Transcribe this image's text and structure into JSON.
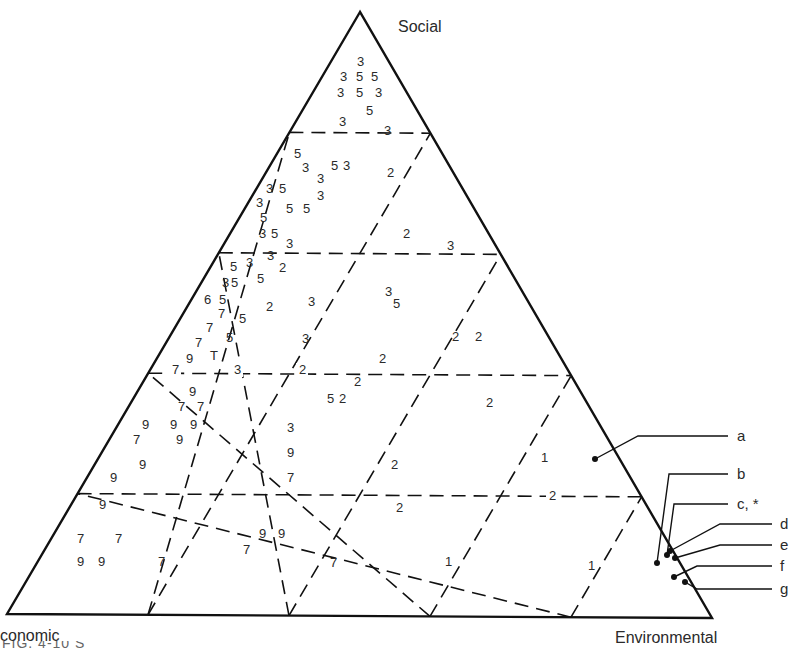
{
  "diagram": {
    "type": "ternary-diagram",
    "vertices": {
      "top": {
        "label": "Social",
        "x": 360,
        "y": 12
      },
      "bottom_left": {
        "label": "conomic",
        "x": 7,
        "y": 614
      },
      "bottom_right": {
        "label": "Environmental",
        "x": 712,
        "y": 618
      }
    },
    "grid_divisions": 5,
    "line_color": "#111111",
    "grid_line_labels": [
      {
        "text": "3",
        "x": 339,
        "y": 126
      },
      {
        "text": "3",
        "x": 286,
        "y": 248
      },
      {
        "text": "3",
        "x": 447,
        "y": 250
      },
      {
        "text": "7",
        "x": 172,
        "y": 374
      },
      {
        "text": "3",
        "x": 234,
        "y": 374
      },
      {
        "text": "2",
        "x": 299,
        "y": 374
      },
      {
        "text": "2",
        "x": 549,
        "y": 500
      }
    ],
    "points": [
      {
        "text": "3",
        "x": 357,
        "y": 66
      },
      {
        "text": "3",
        "x": 340,
        "y": 81
      },
      {
        "text": "5",
        "x": 356,
        "y": 81
      },
      {
        "text": "5",
        "x": 371,
        "y": 81
      },
      {
        "text": "3",
        "x": 337,
        "y": 97
      },
      {
        "text": "5",
        "x": 356,
        "y": 97
      },
      {
        "text": "3",
        "x": 375,
        "y": 97
      },
      {
        "text": "5",
        "x": 366,
        "y": 115
      },
      {
        "text": "3",
        "x": 384,
        "y": 135
      },
      {
        "text": "5",
        "x": 294,
        "y": 158
      },
      {
        "text": "3",
        "x": 302,
        "y": 172
      },
      {
        "text": "5",
        "x": 331,
        "y": 170
      },
      {
        "text": "3",
        "x": 343,
        "y": 170
      },
      {
        "text": "3",
        "x": 317,
        "y": 183
      },
      {
        "text": "2",
        "x": 387,
        "y": 177
      },
      {
        "text": "3",
        "x": 266,
        "y": 193
      },
      {
        "text": "5",
        "x": 279,
        "y": 193
      },
      {
        "text": "3",
        "x": 317,
        "y": 200
      },
      {
        "text": "3",
        "x": 256,
        "y": 207
      },
      {
        "text": "5",
        "x": 286,
        "y": 213
      },
      {
        "text": "5",
        "x": 303,
        "y": 213
      },
      {
        "text": "5",
        "x": 260,
        "y": 222
      },
      {
        "text": "3",
        "x": 259,
        "y": 238
      },
      {
        "text": "5",
        "x": 271,
        "y": 238
      },
      {
        "text": "2",
        "x": 403,
        "y": 238
      },
      {
        "text": "3",
        "x": 267,
        "y": 260
      },
      {
        "text": "5",
        "x": 230,
        "y": 271
      },
      {
        "text": "3",
        "x": 246,
        "y": 267
      },
      {
        "text": "2",
        "x": 279,
        "y": 272
      },
      {
        "text": "3",
        "x": 222,
        "y": 287
      },
      {
        "text": "5",
        "x": 231,
        "y": 287
      },
      {
        "text": "5",
        "x": 257,
        "y": 283
      },
      {
        "text": "6",
        "x": 204,
        "y": 304
      },
      {
        "text": "5",
        "x": 219,
        "y": 304
      },
      {
        "text": "2",
        "x": 266,
        "y": 311
      },
      {
        "text": "3",
        "x": 308,
        "y": 306
      },
      {
        "text": "3",
        "x": 385,
        "y": 296
      },
      {
        "text": "7",
        "x": 218,
        "y": 318
      },
      {
        "text": "5",
        "x": 239,
        "y": 323
      },
      {
        "text": "5",
        "x": 393,
        "y": 308
      },
      {
        "text": "7",
        "x": 206,
        "y": 332
      },
      {
        "text": "7",
        "x": 195,
        "y": 347
      },
      {
        "text": "5",
        "x": 226,
        "y": 342
      },
      {
        "text": "3",
        "x": 302,
        "y": 343
      },
      {
        "text": "2",
        "x": 452,
        "y": 341
      },
      {
        "text": "2",
        "x": 475,
        "y": 341
      },
      {
        "text": "9",
        "x": 186,
        "y": 363
      },
      {
        "text": "T",
        "x": 210,
        "y": 360
      },
      {
        "text": "2",
        "x": 379,
        "y": 363
      },
      {
        "text": "2",
        "x": 354,
        "y": 386
      },
      {
        "text": "9",
        "x": 189,
        "y": 396
      },
      {
        "text": "5",
        "x": 327,
        "y": 403
      },
      {
        "text": "2",
        "x": 339,
        "y": 403
      },
      {
        "text": "2",
        "x": 486,
        "y": 407
      },
      {
        "text": "7",
        "x": 178,
        "y": 411
      },
      {
        "text": "7",
        "x": 197,
        "y": 411
      },
      {
        "text": "9",
        "x": 142,
        "y": 429
      },
      {
        "text": "9",
        "x": 170,
        "y": 429
      },
      {
        "text": "9",
        "x": 190,
        "y": 429
      },
      {
        "text": "3",
        "x": 287,
        "y": 432
      },
      {
        "text": "7",
        "x": 133,
        "y": 444
      },
      {
        "text": "9",
        "x": 176,
        "y": 444
      },
      {
        "text": "9",
        "x": 287,
        "y": 457
      },
      {
        "text": "1",
        "x": 541,
        "y": 462
      },
      {
        "text": "9",
        "x": 139,
        "y": 469
      },
      {
        "text": "2",
        "x": 391,
        "y": 469
      },
      {
        "text": "9",
        "x": 110,
        "y": 482
      },
      {
        "text": "7",
        "x": 287,
        "y": 482
      },
      {
        "text": "9",
        "x": 99,
        "y": 509
      },
      {
        "text": "2",
        "x": 396,
        "y": 512
      },
      {
        "text": "7",
        "x": 77,
        "y": 543
      },
      {
        "text": "7",
        "x": 115,
        "y": 543
      },
      {
        "text": "9",
        "x": 259,
        "y": 538
      },
      {
        "text": "9",
        "x": 278,
        "y": 538
      },
      {
        "text": "7",
        "x": 243,
        "y": 554
      },
      {
        "text": "9",
        "x": 77,
        "y": 566
      },
      {
        "text": "9",
        "x": 98,
        "y": 566
      },
      {
        "text": "7",
        "x": 158,
        "y": 566
      },
      {
        "text": "7",
        "x": 330,
        "y": 567
      },
      {
        "text": "1",
        "x": 445,
        "y": 566
      },
      {
        "text": "1",
        "x": 588,
        "y": 570
      }
    ],
    "legend": [
      {
        "label": "a",
        "dot": [
          595,
          459
        ],
        "path": [
          [
            595,
            459
          ],
          [
            638,
            436
          ],
          [
            728,
            436
          ]
        ],
        "text_x": 737,
        "text_y": 441
      },
      {
        "label": "b",
        "dot": [
          657,
          563
        ],
        "path": [
          [
            657,
            563
          ],
          [
            669,
            474
          ],
          [
            728,
            474
          ]
        ],
        "text_x": 737,
        "text_y": 479
      },
      {
        "label": "c, *",
        "dot": [
          667,
          555
        ],
        "path": [
          [
            667,
            555
          ],
          [
            674,
            504
          ],
          [
            728,
            504
          ]
        ],
        "text_x": 737,
        "text_y": 509
      },
      {
        "label": "d",
        "dot": [
          670,
          551
        ],
        "path": [
          [
            670,
            551
          ],
          [
            720,
            524
          ],
          [
            772,
            524
          ]
        ],
        "text_x": 780,
        "text_y": 529
      },
      {
        "label": "e",
        "dot": [
          675,
          558
        ],
        "path": [
          [
            675,
            558
          ],
          [
            720,
            545
          ],
          [
            772,
            545
          ]
        ],
        "text_x": 780,
        "text_y": 550
      },
      {
        "label": "f",
        "dot": [
          674,
          577
        ],
        "path": [
          [
            674,
            577
          ],
          [
            697,
            566
          ],
          [
            772,
            566
          ]
        ],
        "text_x": 780,
        "text_y": 571
      },
      {
        "label": "g",
        "dot": [
          685,
          582
        ],
        "path": [
          [
            685,
            582
          ],
          [
            697,
            589
          ],
          [
            772,
            589
          ]
        ],
        "text_x": 780,
        "text_y": 594
      }
    ]
  },
  "caption": {
    "text": "FIG. 4-10   S"
  }
}
